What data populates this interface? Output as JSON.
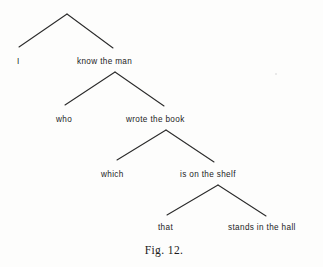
{
  "figure": {
    "caption": "Fig. 12.",
    "caption_x": 164,
    "caption_y": 245,
    "width": 323,
    "height": 267,
    "background_color": "#fdfdfc",
    "line_color": "#2a2a2a",
    "text_color": "#1c1c1c"
  },
  "chart_data": {
    "type": "diagram",
    "subtype": "binary-branching-syntax-tree",
    "title": "Fig. 12.",
    "levels": 4,
    "nodes": [
      {
        "id": "n1",
        "level": 0,
        "apex_x": 67,
        "apex_y": 14
      },
      {
        "id": "n2",
        "level": 1,
        "apex_x": 115,
        "apex_y": 72
      },
      {
        "id": "n3",
        "level": 2,
        "apex_x": 166,
        "apex_y": 130
      },
      {
        "id": "n4",
        "level": 3,
        "apex_x": 218,
        "apex_y": 185
      }
    ],
    "branches": [
      {
        "from": "n1",
        "x1": 67,
        "y1": 14,
        "x2": 19,
        "y2": 47,
        "side": "left"
      },
      {
        "from": "n1",
        "x1": 67,
        "y1": 14,
        "x2": 113,
        "y2": 48,
        "side": "right"
      },
      {
        "from": "n2",
        "x1": 115,
        "y1": 72,
        "x2": 65,
        "y2": 105,
        "side": "left"
      },
      {
        "from": "n2",
        "x1": 115,
        "y1": 72,
        "x2": 164,
        "y2": 106,
        "side": "right"
      },
      {
        "from": "n3",
        "x1": 166,
        "y1": 130,
        "x2": 117,
        "y2": 160,
        "side": "left"
      },
      {
        "from": "n3",
        "x1": 166,
        "y1": 130,
        "x2": 214,
        "y2": 162,
        "side": "right"
      },
      {
        "from": "n4",
        "x1": 218,
        "y1": 185,
        "x2": 167,
        "y2": 215,
        "side": "left"
      },
      {
        "from": "n4",
        "x1": 218,
        "y1": 185,
        "x2": 266,
        "y2": 216,
        "side": "right"
      }
    ],
    "labels": [
      {
        "id": "l1",
        "text": "I",
        "x": 17,
        "y": 58,
        "level": 1,
        "side": "left",
        "align": "left"
      },
      {
        "id": "l2",
        "text": "know the man",
        "x": 77,
        "y": 58,
        "level": 1,
        "side": "right",
        "align": "left"
      },
      {
        "id": "l3",
        "text": "who",
        "x": 56,
        "y": 116,
        "level": 2,
        "side": "left",
        "align": "left"
      },
      {
        "id": "l4",
        "text": "wrote the book",
        "x": 126,
        "y": 116,
        "level": 2,
        "side": "right",
        "align": "left"
      },
      {
        "id": "l5",
        "text": "which",
        "x": 101,
        "y": 171,
        "level": 3,
        "side": "left",
        "align": "left"
      },
      {
        "id": "l6",
        "text": "is on the shelf",
        "x": 180,
        "y": 171,
        "level": 3,
        "side": "right",
        "align": "left"
      },
      {
        "id": "l7",
        "text": "that",
        "x": 158,
        "y": 224,
        "level": 4,
        "side": "left",
        "align": "left"
      },
      {
        "id": "l8",
        "text": "stands in the hall",
        "x": 228,
        "y": 224,
        "level": 4,
        "side": "right",
        "align": "left"
      }
    ],
    "sentence": "I know the man who wrote the book which is on the shelf that stands in the hall",
    "legend": [],
    "grid": false
  },
  "artifacts": [
    {
      "x": 275,
      "y": 73,
      "size": 1.6
    }
  ]
}
